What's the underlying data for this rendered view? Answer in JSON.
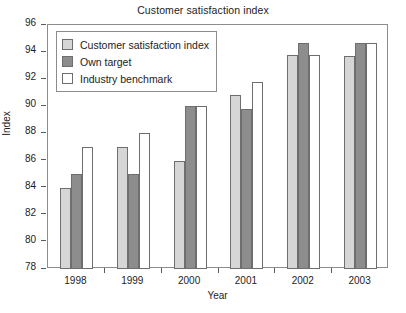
{
  "chart_data": {
    "type": "bar",
    "title": "Customer satisfaction index",
    "xlabel": "Year",
    "ylabel": "Index",
    "categories": [
      "1998",
      "1999",
      "2000",
      "2001",
      "2002",
      "2003"
    ],
    "ylim": [
      78,
      96
    ],
    "yticks": [
      78,
      80,
      82,
      84,
      86,
      88,
      90,
      92,
      94,
      96
    ],
    "grid": false,
    "legend_position": "upper left",
    "series": [
      {
        "name": "Customer satisfaction index",
        "color": "#d6d6d6",
        "values": [
          84,
          87,
          86,
          90.8,
          93.8,
          93.7
        ]
      },
      {
        "name": "Own target",
        "color": "#8d8d8d",
        "values": [
          85,
          85,
          90,
          89.8,
          94.7,
          94.65
        ]
      },
      {
        "name": "Industry benchmark",
        "color": "#ffffff",
        "values": [
          87,
          88,
          90,
          91.8,
          93.8,
          94.65
        ]
      }
    ]
  }
}
